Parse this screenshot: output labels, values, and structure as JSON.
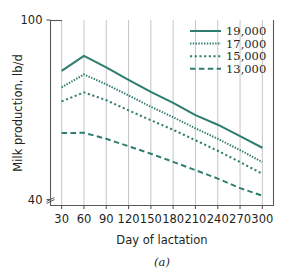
{
  "chart_data": {
    "type": "line",
    "title": "",
    "xlabel": "Day of lactation",
    "ylabel": "Milk production, lb/d",
    "caption": "(a)",
    "x": [
      30,
      60,
      90,
      120,
      150,
      180,
      210,
      240,
      270,
      300
    ],
    "xtick_labels": [
      "30",
      "60",
      "90",
      "120",
      "150",
      "180",
      "210",
      "240",
      "270",
      "300"
    ],
    "ytick_labels": [
      "100",
      "40"
    ],
    "ytick_values": [
      100,
      40
    ],
    "xlim": [
      15,
      315
    ],
    "ylim": [
      38,
      100
    ],
    "axis_break": true,
    "grid": "vertical",
    "legend_position": "top-right",
    "accent_color": "#2e7d6e",
    "grid_color": "#bcbec0",
    "axis_color": "#58595b",
    "series": [
      {
        "name": "19,000",
        "style": "solid",
        "values": [
          83.0,
          88.0,
          84.2,
          80.0,
          76.0,
          72.3,
          68.2,
          65.0,
          61.2,
          57.3
        ]
      },
      {
        "name": "17,000",
        "style": "fine-dotted",
        "values": [
          77.5,
          81.8,
          78.5,
          74.8,
          71.0,
          67.5,
          63.8,
          60.3,
          56.5,
          52.5
        ]
      },
      {
        "name": "15,000",
        "style": "coarse-dotted",
        "values": [
          72.8,
          75.8,
          73.2,
          69.8,
          66.5,
          63.3,
          59.8,
          56.3,
          52.5,
          48.6
        ]
      },
      {
        "name": "13,000",
        "style": "dashed",
        "values": [
          62.2,
          62.3,
          60.3,
          57.8,
          55.3,
          52.6,
          49.8,
          47.0,
          43.8,
          41.3
        ]
      }
    ]
  },
  "legend": {
    "entries": [
      {
        "label": "19,000"
      },
      {
        "label": "17,000"
      },
      {
        "label": "15,000"
      },
      {
        "label": "13,000"
      }
    ]
  }
}
